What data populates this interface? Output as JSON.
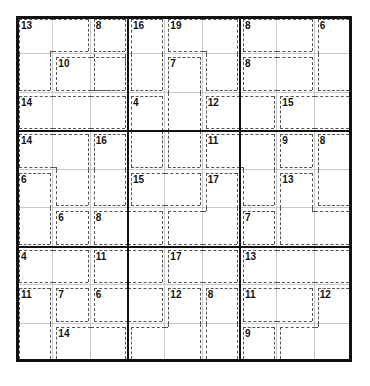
{
  "puzzle": {
    "type": "killer-sudoku",
    "size": 9,
    "colors": {
      "grid_line": "#c8c8c8",
      "box_line": "#111111",
      "cage_line": "#555555",
      "background": "#ffffff"
    },
    "cages": [
      {
        "sum": "13",
        "cells": [
          [
            0,
            0
          ],
          [
            0,
            1
          ],
          [
            1,
            0
          ]
        ]
      },
      {
        "sum": "8",
        "cells": [
          [
            0,
            2
          ],
          [
            1,
            2
          ]
        ]
      },
      {
        "sum": "10",
        "cells": [
          [
            1,
            1
          ],
          [
            1,
            2
          ]
        ]
      },
      {
        "sum": "14",
        "cells": [
          [
            2,
            0
          ],
          [
            2,
            1
          ],
          [
            2,
            2
          ]
        ]
      },
      {
        "sum": "16",
        "cells": [
          [
            0,
            3
          ],
          [
            1,
            3
          ]
        ]
      },
      {
        "sum": "19",
        "cells": [
          [
            0,
            4
          ],
          [
            0,
            5
          ],
          [
            1,
            5
          ]
        ]
      },
      {
        "sum": "7",
        "cells": [
          [
            1,
            4
          ],
          [
            2,
            4
          ],
          [
            3,
            4
          ]
        ]
      },
      {
        "sum": "4",
        "cells": [
          [
            2,
            3
          ],
          [
            3,
            3
          ]
        ]
      },
      {
        "sum": "12",
        "cells": [
          [
            2,
            5
          ],
          [
            2,
            6
          ]
        ]
      },
      {
        "sum": "8",
        "cells": [
          [
            0,
            6
          ],
          [
            0,
            7
          ]
        ]
      },
      {
        "sum": "6",
        "cells": [
          [
            0,
            8
          ],
          [
            1,
            8
          ]
        ]
      },
      {
        "sum": "8",
        "cells": [
          [
            1,
            6
          ],
          [
            1,
            7
          ]
        ]
      },
      {
        "sum": "15",
        "cells": [
          [
            2,
            7
          ],
          [
            2,
            8
          ]
        ]
      },
      {
        "sum": "14",
        "cells": [
          [
            3,
            0
          ],
          [
            3,
            1
          ],
          [
            4,
            1
          ]
        ]
      },
      {
        "sum": "16",
        "cells": [
          [
            3,
            2
          ],
          [
            4,
            2
          ]
        ]
      },
      {
        "sum": "6",
        "cells": [
          [
            4,
            0
          ],
          [
            5,
            0
          ]
        ]
      },
      {
        "sum": "6",
        "cells": [
          [
            5,
            1
          ]
        ]
      },
      {
        "sum": "8",
        "cells": [
          [
            5,
            2
          ],
          [
            5,
            3
          ]
        ]
      },
      {
        "sum": "11",
        "cells": [
          [
            3,
            5
          ],
          [
            3,
            6
          ],
          [
            4,
            6
          ]
        ]
      },
      {
        "sum": "15",
        "cells": [
          [
            4,
            3
          ],
          [
            4,
            4
          ]
        ]
      },
      {
        "sum": "17",
        "cells": [
          [
            4,
            5
          ],
          [
            5,
            4
          ],
          [
            5,
            5
          ]
        ]
      },
      {
        "sum": "9",
        "cells": [
          [
            3,
            7
          ]
        ]
      },
      {
        "sum": "8",
        "cells": [
          [
            3,
            8
          ],
          [
            4,
            8
          ]
        ]
      },
      {
        "sum": "13",
        "cells": [
          [
            4,
            7
          ],
          [
            5,
            7
          ],
          [
            5,
            8
          ]
        ]
      },
      {
        "sum": "7",
        "cells": [
          [
            5,
            6
          ]
        ]
      },
      {
        "sum": "4",
        "cells": [
          [
            6,
            0
          ],
          [
            6,
            1
          ]
        ]
      },
      {
        "sum": "11",
        "cells": [
          [
            6,
            2
          ],
          [
            6,
            3
          ]
        ]
      },
      {
        "sum": "11",
        "cells": [
          [
            7,
            0
          ],
          [
            8,
            0
          ]
        ]
      },
      {
        "sum": "7",
        "cells": [
          [
            7,
            1
          ]
        ]
      },
      {
        "sum": "6",
        "cells": [
          [
            7,
            2
          ],
          [
            7,
            3
          ]
        ]
      },
      {
        "sum": "14",
        "cells": [
          [
            8,
            1
          ],
          [
            8,
            2
          ]
        ]
      },
      {
        "sum": "17",
        "cells": [
          [
            6,
            4
          ],
          [
            6,
            5
          ]
        ]
      },
      {
        "sum": "12",
        "cells": [
          [
            7,
            4
          ],
          [
            8,
            3
          ],
          [
            8,
            4
          ]
        ]
      },
      {
        "sum": "8",
        "cells": [
          [
            7,
            5
          ],
          [
            8,
            5
          ]
        ]
      },
      {
        "sum": "13",
        "cells": [
          [
            6,
            6
          ],
          [
            6,
            7
          ],
          [
            6,
            8
          ]
        ]
      },
      {
        "sum": "11",
        "cells": [
          [
            7,
            6
          ],
          [
            7,
            7
          ]
        ]
      },
      {
        "sum": "12",
        "cells": [
          [
            7,
            8
          ],
          [
            8,
            7
          ],
          [
            8,
            8
          ]
        ]
      },
      {
        "sum": "9",
        "cells": [
          [
            8,
            6
          ]
        ]
      }
    ]
  }
}
